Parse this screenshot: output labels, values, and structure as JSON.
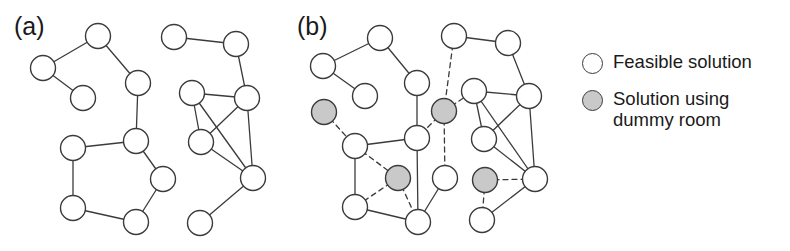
{
  "figure": {
    "width": 790,
    "height": 251,
    "background": "#ffffff",
    "node_radius": 12.5,
    "node_fill_feasible": "#ffffff",
    "node_fill_dummy": "#c9c9c9",
    "node_stroke": "#3b3b3b",
    "edge_stroke": "#3b3b3b",
    "edge_width": 1.3,
    "dashed_pattern": "5,4"
  },
  "panels": [
    {
      "id": "a",
      "label": "(a)",
      "label_x": 14,
      "label_y": 14,
      "nodes": [
        {
          "id": "a0",
          "x": 98,
          "y": 36,
          "type": "feasible"
        },
        {
          "id": "a1",
          "x": 43,
          "y": 68,
          "type": "feasible"
        },
        {
          "id": "a2",
          "x": 83,
          "y": 98,
          "type": "feasible"
        },
        {
          "id": "a3",
          "x": 138,
          "y": 83,
          "type": "feasible"
        },
        {
          "id": "a4",
          "x": 136,
          "y": 141,
          "type": "feasible"
        },
        {
          "id": "a5",
          "x": 73,
          "y": 148,
          "type": "feasible"
        },
        {
          "id": "a6",
          "x": 163,
          "y": 179,
          "type": "feasible"
        },
        {
          "id": "a7",
          "x": 73,
          "y": 208,
          "type": "feasible"
        },
        {
          "id": "a8",
          "x": 136,
          "y": 222,
          "type": "feasible"
        },
        {
          "id": "a9",
          "x": 174,
          "y": 37,
          "type": "feasible"
        },
        {
          "id": "a10",
          "x": 236,
          "y": 44,
          "type": "feasible"
        },
        {
          "id": "a11",
          "x": 192,
          "y": 93,
          "type": "feasible"
        },
        {
          "id": "a12",
          "x": 247,
          "y": 98,
          "type": "feasible"
        },
        {
          "id": "a13",
          "x": 201,
          "y": 142,
          "type": "feasible"
        },
        {
          "id": "a14",
          "x": 253,
          "y": 178,
          "type": "feasible"
        },
        {
          "id": "a15",
          "x": 200,
          "y": 223,
          "type": "feasible"
        }
      ],
      "edges": [
        {
          "from": "a0",
          "to": "a1",
          "style": "solid"
        },
        {
          "from": "a1",
          "to": "a2",
          "style": "solid"
        },
        {
          "from": "a0",
          "to": "a3",
          "style": "solid"
        },
        {
          "from": "a3",
          "to": "a4",
          "style": "solid"
        },
        {
          "from": "a4",
          "to": "a5",
          "style": "solid"
        },
        {
          "from": "a4",
          "to": "a6",
          "style": "solid"
        },
        {
          "from": "a5",
          "to": "a7",
          "style": "solid"
        },
        {
          "from": "a7",
          "to": "a8",
          "style": "solid"
        },
        {
          "from": "a8",
          "to": "a6",
          "style": "solid"
        },
        {
          "from": "a9",
          "to": "a10",
          "style": "solid"
        },
        {
          "from": "a10",
          "to": "a12",
          "style": "solid"
        },
        {
          "from": "a11",
          "to": "a12",
          "style": "solid"
        },
        {
          "from": "a11",
          "to": "a13",
          "style": "solid"
        },
        {
          "from": "a11",
          "to": "a14",
          "style": "solid"
        },
        {
          "from": "a12",
          "to": "a13",
          "style": "solid"
        },
        {
          "from": "a12",
          "to": "a14",
          "style": "solid"
        },
        {
          "from": "a13",
          "to": "a14",
          "style": "solid"
        },
        {
          "from": "a14",
          "to": "a15",
          "style": "solid"
        }
      ]
    },
    {
      "id": "b",
      "label": "(b)",
      "label_x": 297,
      "label_y": 14,
      "nodes": [
        {
          "id": "b0",
          "x": 380,
          "y": 38,
          "type": "feasible"
        },
        {
          "id": "b1",
          "x": 323,
          "y": 66,
          "type": "feasible"
        },
        {
          "id": "b2",
          "x": 365,
          "y": 96,
          "type": "feasible"
        },
        {
          "id": "b3",
          "x": 417,
          "y": 83,
          "type": "feasible"
        },
        {
          "id": "b4",
          "x": 324,
          "y": 112,
          "type": "dummy"
        },
        {
          "id": "b5",
          "x": 355,
          "y": 146,
          "type": "feasible"
        },
        {
          "id": "b6",
          "x": 417,
          "y": 138,
          "type": "feasible"
        },
        {
          "id": "b7",
          "x": 398,
          "y": 178,
          "type": "dummy"
        },
        {
          "id": "b8",
          "x": 355,
          "y": 207,
          "type": "feasible"
        },
        {
          "id": "b9",
          "x": 418,
          "y": 222,
          "type": "feasible"
        },
        {
          "id": "b10",
          "x": 454,
          "y": 36,
          "type": "feasible"
        },
        {
          "id": "b11",
          "x": 508,
          "y": 43,
          "type": "feasible"
        },
        {
          "id": "b12",
          "x": 444,
          "y": 111,
          "type": "dummy"
        },
        {
          "id": "b13",
          "x": 474,
          "y": 91,
          "type": "feasible"
        },
        {
          "id": "b14",
          "x": 529,
          "y": 96,
          "type": "feasible"
        },
        {
          "id": "b15",
          "x": 484,
          "y": 139,
          "type": "feasible"
        },
        {
          "id": "b16",
          "x": 445,
          "y": 178,
          "type": "feasible"
        },
        {
          "id": "b17",
          "x": 485,
          "y": 180,
          "type": "dummy"
        },
        {
          "id": "b18",
          "x": 535,
          "y": 179,
          "type": "feasible"
        },
        {
          "id": "b19",
          "x": 482,
          "y": 220,
          "type": "feasible"
        }
      ],
      "edges": [
        {
          "from": "b0",
          "to": "b1",
          "style": "solid"
        },
        {
          "from": "b1",
          "to": "b2",
          "style": "solid"
        },
        {
          "from": "b0",
          "to": "b3",
          "style": "solid"
        },
        {
          "from": "b3",
          "to": "b6",
          "style": "solid"
        },
        {
          "from": "b4",
          "to": "b5",
          "style": "dashed"
        },
        {
          "from": "b5",
          "to": "b6",
          "style": "solid"
        },
        {
          "from": "b5",
          "to": "b8",
          "style": "solid"
        },
        {
          "from": "b5",
          "to": "b7",
          "style": "dashed"
        },
        {
          "from": "b6",
          "to": "b9",
          "style": "solid"
        },
        {
          "from": "b7",
          "to": "b8",
          "style": "dashed"
        },
        {
          "from": "b7",
          "to": "b9",
          "style": "dashed"
        },
        {
          "from": "b8",
          "to": "b9",
          "style": "solid"
        },
        {
          "from": "b9",
          "to": "b16",
          "style": "solid"
        },
        {
          "from": "b10",
          "to": "b11",
          "style": "solid"
        },
        {
          "from": "b10",
          "to": "b12",
          "style": "dashed"
        },
        {
          "from": "b11",
          "to": "b14",
          "style": "solid"
        },
        {
          "from": "b12",
          "to": "b6",
          "style": "dashed"
        },
        {
          "from": "b12",
          "to": "b13",
          "style": "dashed"
        },
        {
          "from": "b12",
          "to": "b16",
          "style": "dashed"
        },
        {
          "from": "b13",
          "to": "b14",
          "style": "solid"
        },
        {
          "from": "b13",
          "to": "b15",
          "style": "solid"
        },
        {
          "from": "b13",
          "to": "b18",
          "style": "solid"
        },
        {
          "from": "b14",
          "to": "b15",
          "style": "solid"
        },
        {
          "from": "b14",
          "to": "b18",
          "style": "solid"
        },
        {
          "from": "b15",
          "to": "b18",
          "style": "solid"
        },
        {
          "from": "b17",
          "to": "b18",
          "style": "dashed"
        },
        {
          "from": "b17",
          "to": "b19",
          "style": "dashed"
        },
        {
          "from": "b18",
          "to": "b19",
          "style": "solid"
        }
      ]
    }
  ],
  "legend": {
    "items": [
      {
        "marker": "feasible",
        "label": "Feasible solution"
      },
      {
        "marker": "dummy",
        "label": "Solution using\ndummy room"
      }
    ]
  }
}
